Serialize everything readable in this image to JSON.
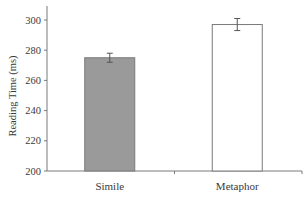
{
  "chart_data": {
    "type": "bar",
    "title": "",
    "xlabel": "",
    "ylabel": "Reading Time (ms)",
    "categories": [
      "Simile",
      "Metaphor"
    ],
    "values": [
      275,
      297
    ],
    "errors": [
      3,
      4
    ],
    "ylim": [
      200,
      305
    ],
    "yticks": [
      200,
      220,
      240,
      260,
      280,
      300
    ],
    "grid": false,
    "legend": null,
    "bar_colors": [
      "#9a9a9a",
      "#ffffff"
    ],
    "bar_edge_color": "#7a7a7a"
  }
}
